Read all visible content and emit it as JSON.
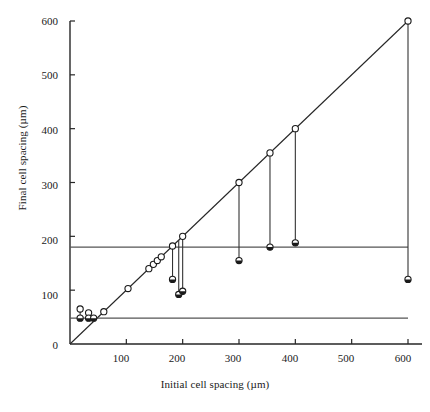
{
  "chart_data": {
    "type": "scatter",
    "title": "",
    "xlabel": "Initial cell spacing (µm)",
    "ylabel": "Final cell spacing (µm)",
    "xlim": [
      0,
      620
    ],
    "ylim": [
      0,
      620
    ],
    "xticks": [
      100,
      200,
      300,
      400,
      500,
      600
    ],
    "yticks": [
      0,
      100,
      200,
      300,
      400,
      500,
      600
    ],
    "xtick_labels": [
      "100",
      "200",
      "300",
      "400",
      "500",
      "600"
    ],
    "ytick_labels": [
      "0",
      "100",
      "200",
      "300",
      "400",
      "500",
      "600"
    ],
    "grid": false,
    "legend": null,
    "reference_lines": [
      {
        "name": "identity-line",
        "type": "diagonal",
        "from": [
          0,
          0
        ],
        "to": [
          600,
          600
        ],
        "note": "y = x, no change in spacing"
      },
      {
        "name": "upper-threshold",
        "type": "horizontal",
        "y": 180,
        "x_from": 0,
        "x_to": 600
      },
      {
        "name": "lower-threshold",
        "type": "horizontal",
        "y": 48,
        "x_from": 0,
        "x_to": 600
      }
    ],
    "series": [
      {
        "name": "unchanged-spacing",
        "marker": "open-circle",
        "points": [
          {
            "x": 18,
            "y": 65
          },
          {
            "x": 33,
            "y": 58
          },
          {
            "x": 60,
            "y": 60
          },
          {
            "x": 103,
            "y": 103
          },
          {
            "x": 140,
            "y": 140
          },
          {
            "x": 148,
            "y": 148
          },
          {
            "x": 155,
            "y": 155
          },
          {
            "x": 162,
            "y": 162
          },
          {
            "x": 182,
            "y": 182
          },
          {
            "x": 200,
            "y": 200
          },
          {
            "x": 300,
            "y": 300
          },
          {
            "x": 355,
            "y": 355
          },
          {
            "x": 400,
            "y": 400
          },
          {
            "x": 600,
            "y": 600
          }
        ]
      },
      {
        "name": "reduced-spacing",
        "marker": "filled-circle",
        "note": "final spacing after reduction; joined to initial value by vertical drop line",
        "points": [
          {
            "x": 18,
            "y": 48
          },
          {
            "x": 33,
            "y": 48
          },
          {
            "x": 42,
            "y": 48
          },
          {
            "x": 182,
            "y": 120
          },
          {
            "x": 193,
            "y": 92
          },
          {
            "x": 200,
            "y": 98
          },
          {
            "x": 300,
            "y": 155
          },
          {
            "x": 355,
            "y": 180
          },
          {
            "x": 400,
            "y": 188
          },
          {
            "x": 600,
            "y": 120
          }
        ]
      }
    ],
    "drop_lines": [
      {
        "x": 18,
        "y_top": 65,
        "y_bottom": 48
      },
      {
        "x": 33,
        "y_top": 58,
        "y_bottom": 48
      },
      {
        "x": 182,
        "y_top": 182,
        "y_bottom": 120
      },
      {
        "x": 193,
        "y_top": 193,
        "y_bottom": 92
      },
      {
        "x": 200,
        "y_top": 200,
        "y_bottom": 98
      },
      {
        "x": 300,
        "y_top": 300,
        "y_bottom": 155
      },
      {
        "x": 355,
        "y_top": 355,
        "y_bottom": 180
      },
      {
        "x": 400,
        "y_top": 400,
        "y_bottom": 188
      },
      {
        "x": 600,
        "y_top": 600,
        "y_bottom": 120
      }
    ],
    "colors": {
      "axis": "#262626",
      "reference_line": "#555555",
      "marker_edge": "#1a1a1a",
      "marker_fill": "#ffffff",
      "drop_line": "#333333",
      "background": "#ffffff"
    }
  }
}
